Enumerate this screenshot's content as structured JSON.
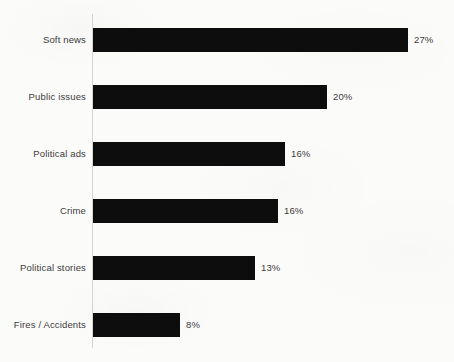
{
  "chart_data": {
    "type": "bar",
    "orientation": "horizontal",
    "title": "",
    "subtitle": "",
    "xlabel": "",
    "ylabel": "",
    "xlim": [
      0,
      30
    ],
    "grid": false,
    "legend": false,
    "value_suffix": "%",
    "categories": [
      "Soft news",
      "Public issues",
      "Political ads",
      "Crime",
      "Political stories",
      "Fires / Accidents"
    ],
    "values": [
      27,
      20,
      16,
      16,
      13,
      8
    ],
    "value_labels": [
      "27%",
      "20%",
      "16%",
      "16%",
      "13%",
      "8%"
    ],
    "bars": [
      {
        "category": "Soft news",
        "value": 27,
        "label": "27%",
        "bar_end_px": 408,
        "row_top_px": 28
      },
      {
        "category": "Public issues",
        "value": 20,
        "label": "20%",
        "bar_end_px": 327,
        "row_top_px": 85
      },
      {
        "category": "Political ads",
        "value": 16,
        "label": "16%",
        "bar_end_px": 285,
        "row_top_px": 142
      },
      {
        "category": "Crime",
        "value": 16,
        "label": "16%",
        "bar_end_px": 278,
        "row_top_px": 199
      },
      {
        "category": "Political stories",
        "value": 13,
        "label": "13%",
        "bar_end_px": 255,
        "row_top_px": 256
      },
      {
        "category": "Fires / Accidents",
        "value": 8,
        "label": "8%",
        "bar_end_px": 180,
        "row_top_px": 313
      }
    ],
    "colors": {
      "bar": "#0d0d0d",
      "background": "#fbfbfa",
      "text": "#3b3b3b",
      "axis_line": "#d4d4d2"
    }
  }
}
